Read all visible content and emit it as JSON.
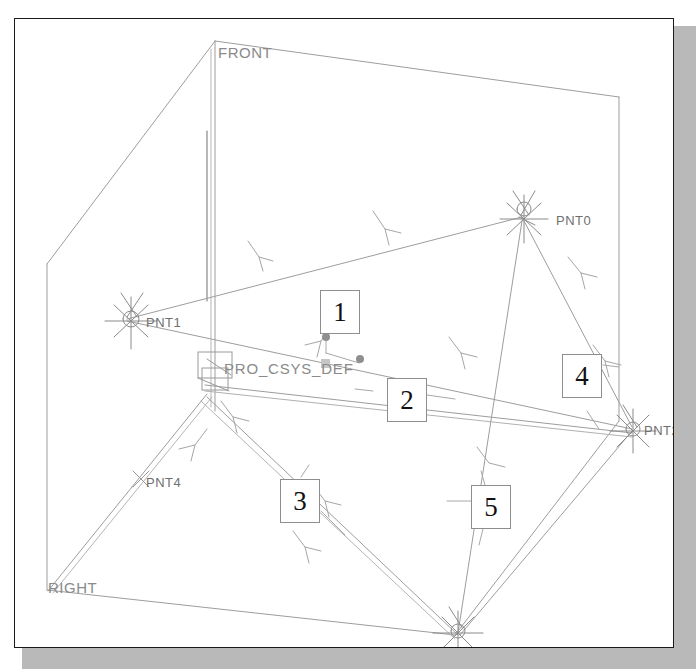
{
  "application": {
    "type": "cad-wireframe-viewer",
    "view_title": "3D datum point wireframe"
  },
  "canvas": {
    "background_color": "#ffffff",
    "border_color": "#1a1a1a",
    "shadow_color": "#b9b9b9",
    "wire_color": "#9a9a9a",
    "label_color": "#6f6f6f"
  },
  "cad_labels": {
    "front_plane": "FRONT",
    "right_plane": "RIGHT",
    "coordinate_system": "PRO_CSYS_DEF",
    "points": [
      {
        "name": "PNT0"
      },
      {
        "name": "PNT1"
      },
      {
        "name": "PNT2"
      },
      {
        "name": "PNT3"
      },
      {
        "name": "PNT4"
      }
    ]
  },
  "callouts": [
    {
      "id": "callout-1",
      "label": "1"
    },
    {
      "id": "callout-2",
      "label": "2"
    },
    {
      "id": "callout-3",
      "label": "3"
    },
    {
      "id": "callout-4",
      "label": "4"
    },
    {
      "id": "callout-5",
      "label": "5"
    }
  ]
}
